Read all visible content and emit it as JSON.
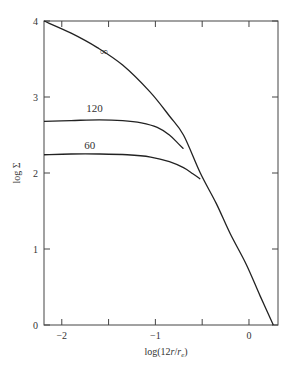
{
  "chart_data": {
    "type": "line",
    "title": "",
    "xlabel": "log(12r/r_e)",
    "xlabel_main": "log(12",
    "xlabel_r": "r",
    "xlabel_slash": "/",
    "xlabel_re": "r",
    "xlabel_sub": "e",
    "xlabel_close": ")",
    "ylabel": "log Σ",
    "xlim": [
      -2.19,
      0.31
    ],
    "ylim": [
      0,
      4
    ],
    "grid": false,
    "xticks": [
      {
        "v": -2,
        "label": "−2"
      },
      {
        "v": -1.5,
        "label": ""
      },
      {
        "v": -1,
        "label": "−1"
      },
      {
        "v": -0.5,
        "label": ""
      },
      {
        "v": 0,
        "label": "0"
      }
    ],
    "yticks": [
      {
        "v": 0,
        "label": "0"
      },
      {
        "v": 1,
        "label": "1"
      },
      {
        "v": 2,
        "label": "2"
      },
      {
        "v": 3,
        "label": "3"
      },
      {
        "v": 4,
        "label": "4"
      }
    ],
    "series": [
      {
        "name": "∞",
        "label": "∞",
        "label_at": [
          -1.55,
          3.55
        ],
        "x": [
          -2.19,
          -1.9,
          -1.62,
          -1.35,
          -1.06,
          -0.85,
          -0.7,
          -0.52,
          -0.35,
          -0.2,
          -0.03,
          0.12,
          0.26
        ],
        "y": [
          4.0,
          3.84,
          3.65,
          3.42,
          3.07,
          2.75,
          2.5,
          2.0,
          1.6,
          1.2,
          0.8,
          0.38,
          0.0
        ]
      },
      {
        "name": "120",
        "label": "120",
        "label_at": [
          -1.65,
          2.8
        ],
        "x": [
          -2.19,
          -1.9,
          -1.6,
          -1.35,
          -1.15,
          -0.98,
          -0.85,
          -0.75,
          -0.7
        ],
        "y": [
          2.68,
          2.69,
          2.7,
          2.69,
          2.66,
          2.6,
          2.5,
          2.38,
          2.32
        ]
      },
      {
        "name": "60",
        "label": "60",
        "label_at": [
          -1.7,
          2.32
        ],
        "x": [
          -2.19,
          -1.9,
          -1.6,
          -1.3,
          -1.05,
          -0.85,
          -0.7,
          -0.6,
          -0.52
        ],
        "y": [
          2.24,
          2.25,
          2.25,
          2.24,
          2.21,
          2.15,
          2.07,
          1.99,
          1.92
        ]
      }
    ]
  }
}
